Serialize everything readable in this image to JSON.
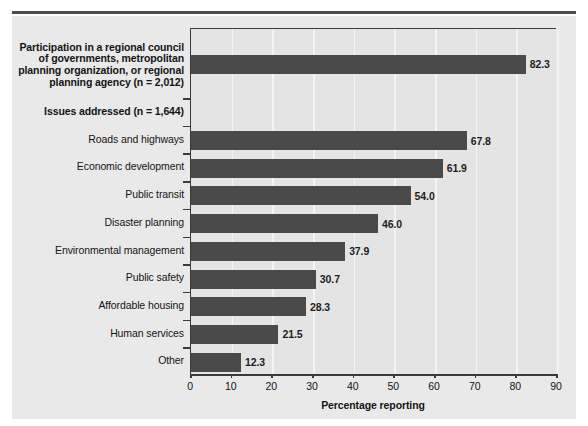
{
  "figure": {
    "cut_caption": "",
    "panel_bg": "#e9e9e9",
    "bar_color": "#4a4a4a",
    "axis_color": "#3a3a3a",
    "grid_color": "#f4f4f4"
  },
  "chart_data": {
    "type": "bar",
    "orientation": "horizontal",
    "title": "",
    "xlabel": "Percentage reporting",
    "ylabel": "",
    "xlim": [
      0,
      90
    ],
    "xticks": [
      0,
      10,
      20,
      30,
      40,
      50,
      60,
      70,
      80,
      90
    ],
    "grid": true,
    "grid_axis": "x",
    "legend": "none",
    "categories": [
      "Participation in a regional council\nof governments, metropolitan\nplanning organization, or regional\nplanning agency (n = 2,012)",
      "Issues addressed (n = 1,644)",
      "Roads and highways",
      "Economic development",
      "Public transit",
      "Disaster planning",
      "Environmental management",
      "Public safety",
      "Affordable housing",
      "Human services",
      "Other"
    ],
    "category_styles": [
      "bold",
      "bold",
      "normal",
      "normal",
      "normal",
      "normal",
      "normal",
      "normal",
      "normal",
      "normal",
      "normal"
    ],
    "values": [
      82.3,
      null,
      67.8,
      61.9,
      54.0,
      46.0,
      37.9,
      30.7,
      28.3,
      21.5,
      12.3
    ],
    "value_labels": [
      "82.3",
      "",
      "67.8",
      "61.9",
      "54.0",
      "46.0",
      "37.9",
      "30.7",
      "28.3",
      "21.5",
      "12.3"
    ]
  }
}
